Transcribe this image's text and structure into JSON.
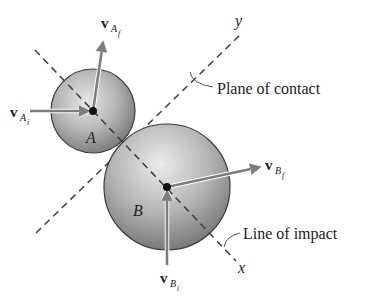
{
  "diagram": {
    "colors": {
      "background": "#ffffff",
      "sphere_light": "#d8d8d8",
      "sphere_dark": "#7a7a7a",
      "outline": "#3a3a3a",
      "arrow": "#7d7d7d",
      "dash": "#4a4a4a",
      "text": "#222222"
    },
    "axes": {
      "x_label": "x",
      "y_label": "y"
    },
    "bodies": {
      "a": {
        "label": "A",
        "center": [
          93,
          111
        ],
        "radius": 42
      },
      "b": {
        "label": "B",
        "center": [
          167,
          187
        ],
        "radius": 63
      }
    },
    "vectors": {
      "va_i": {
        "symbol": "v",
        "sub": "A",
        "subsub": "i"
      },
      "va_f": {
        "symbol": "v",
        "sub": "A",
        "subsub": "f"
      },
      "vb_i": {
        "symbol": "v",
        "sub": "B",
        "subsub": "i"
      },
      "vb_f": {
        "symbol": "v",
        "sub": "B",
        "subsub": "f"
      }
    },
    "annotations": {
      "plane_of_contact": "Plane of contact",
      "line_of_impact": "Line of impact"
    }
  }
}
